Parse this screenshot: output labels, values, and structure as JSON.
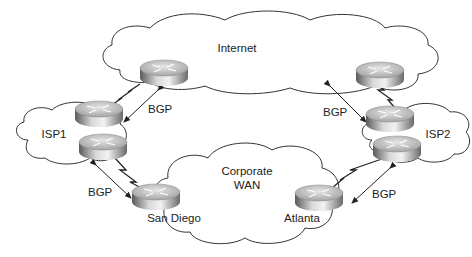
{
  "diagram": {
    "clouds": {
      "internet": {
        "label": "Internet"
      },
      "isp1": {
        "label": "ISP1"
      },
      "isp2": {
        "label": "ISP2"
      },
      "corporate_wan": {
        "label_line1": "Corporate",
        "label_line2": "WAN"
      }
    },
    "routers": {
      "san_diego": {
        "label": "San Diego"
      },
      "atlanta": {
        "label": "Atlanta"
      }
    },
    "links": {
      "isp1_internet": {
        "protocol": "BGP"
      },
      "isp1_sandiego": {
        "protocol": "BGP"
      },
      "isp2_internet": {
        "protocol": "BGP"
      },
      "isp2_atlanta": {
        "protocol": "BGP"
      }
    },
    "colors": {
      "line": "#222222",
      "cloud_outline": "#333333",
      "router_top": "#c8c8c8",
      "router_side_dark": "#6e6e6e"
    }
  }
}
